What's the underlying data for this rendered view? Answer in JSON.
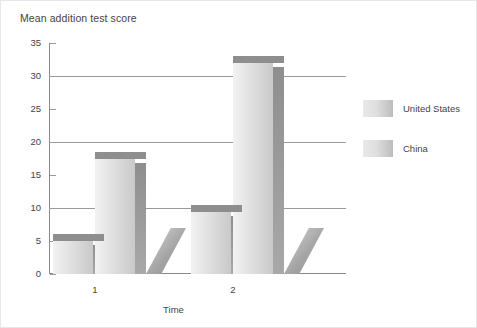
{
  "chart_data": {
    "type": "bar",
    "title": "Mean addition test score",
    "xlabel": "Time",
    "ylabel": "",
    "categories": [
      "1",
      "2"
    ],
    "series": [
      {
        "name": "United States",
        "values": [
          6,
          10.5
        ]
      },
      {
        "name": "China",
        "values": [
          18.5,
          33
        ]
      }
    ],
    "ylim": [
      0,
      35
    ],
    "yticks": [
      0,
      5,
      10,
      15,
      20,
      25,
      30,
      35
    ],
    "ytick_labels": [
      "0",
      "5",
      "10",
      "15",
      "20",
      "25",
      "30",
      "35"
    ],
    "gridlines_at": [
      10,
      20,
      30
    ],
    "grid": true,
    "legend_position": "right",
    "style": "3d-bar",
    "colors": {
      "bar_face_light": "#f2f2f2",
      "bar_face_dark": "#c9c9c9",
      "bar_top": "#8e8e8e",
      "bar_side": "#a8a8a8",
      "gridline": "#9a9a9a",
      "axis": "#8a8a8a",
      "text": "#444444",
      "background": "#ffffff"
    }
  },
  "legend": {
    "items": [
      {
        "label": "United States"
      },
      {
        "label": "China"
      }
    ]
  }
}
